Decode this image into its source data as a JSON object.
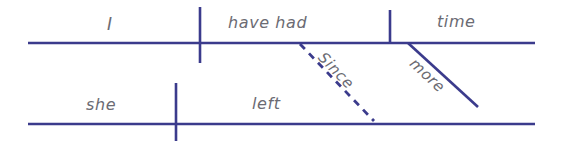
{
  "diagram": {
    "type": "reed-kellogg-sentence-diagram",
    "sentence": "I have had more time since she left.",
    "background_color": "#ffffff",
    "line_color": "#3b3b8c",
    "text_color": "#6b6b73",
    "main_clause": {
      "baseline": {
        "x1": 28,
        "y1": 43,
        "x2": 535,
        "y2": 43
      },
      "subject": {
        "text": "I",
        "x": 112,
        "y": 24
      },
      "predicate": {
        "text": "have had",
        "x": 265,
        "y": 23
      },
      "direct_object": {
        "text": "time",
        "x": 462,
        "y": 22
      },
      "subject_predicate_divider": {
        "x": 200,
        "y1": 7,
        "y2": 63
      },
      "verb_object_divider": {
        "x": 390,
        "y1": 10,
        "y2": 44
      },
      "modifier": {
        "text": "more",
        "line": {
          "x1": 408,
          "y1": 43,
          "x2": 478,
          "y2": 107
        },
        "style": "solid"
      }
    },
    "subordinate_clause": {
      "baseline": {
        "x1": 28,
        "y1": 124,
        "x2": 535,
        "y2": 124
      },
      "subject": {
        "text": "she",
        "x": 106,
        "y": 105
      },
      "predicate": {
        "text": "left",
        "x": 275,
        "y": 104
      },
      "subject_predicate_divider": {
        "x": 176,
        "y1": 83,
        "y2": 141
      }
    },
    "connector": {
      "text": "Since",
      "line": {
        "x1": 300,
        "y1": 44,
        "x2": 374,
        "y2": 121
      },
      "style": "dashed",
      "dash_pattern": "7 6"
    }
  }
}
